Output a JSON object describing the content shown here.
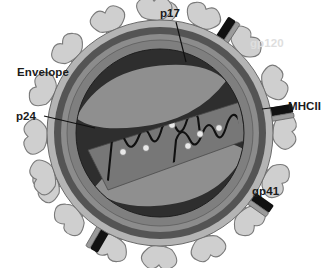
{
  "figure": {
    "background_color": "#ffffff",
    "width": 330,
    "height": 268
  },
  "labels": {
    "p17": "p17",
    "gp120": "gp120",
    "envelope": "Envelope",
    "p24": "p24",
    "mhcii": "MHCII",
    "gp41": "gp41"
  },
  "colors": {
    "background": "#ffffff",
    "envelope_outer_ring": "#b4b4b4",
    "envelope_dark_ring": "#545454",
    "envelope_mid_ring": "#8c8c8c",
    "matrix": "#7f7f7f",
    "interior_dark": "#2e2e2e",
    "capsid_band": "#777777",
    "lens_light": "#8f8f8f",
    "gp120_knob": "#cfcfcf",
    "gp120_knob_outline": "#7a7a7a",
    "gp41_stalk": "#a8a8a8",
    "mhcii_bar": "#111111",
    "mhcii_bar_stripe": "#9a9a9a",
    "rna_strand": "#101010",
    "enzyme_dot": "#e8e8e8",
    "label_dark": "#1b1b1b",
    "label_faded": "#dedede",
    "leader_line": "#101010"
  },
  "structure": {
    "virion_center": {
      "x": 160,
      "y": 133
    },
    "virion_radius": 113,
    "rings": [
      {
        "name": "outer-envelope-ring",
        "radius": 113,
        "color": "#b4b4b4"
      },
      {
        "name": "lipid-bilayer-dark-ring",
        "radius": 106,
        "color": "#545454"
      },
      {
        "name": "inner-envelope-ring",
        "radius": 99,
        "color": "#8c8c8c"
      },
      {
        "name": "matrix-p17-layer",
        "radius": 93,
        "color": "#7f7f7f"
      },
      {
        "name": "core-interior",
        "radius": 84,
        "color": "#2e2e2e"
      }
    ],
    "spike_count": 18,
    "mhcii_count": 4,
    "enzyme_dot_count": 6,
    "rna_strand_count": 2
  },
  "leader_lines": {
    "p17": {
      "from_x": 176,
      "from_y": 22,
      "to_x": 186,
      "to_y": 62
    },
    "p24": {
      "from_x": 44,
      "from_y": 116,
      "to_x": 95,
      "to_y": 128
    },
    "mhcii": {
      "from_x": 286,
      "from_y": 106,
      "to_x": 262,
      "to_y": 109
    }
  },
  "legend_items": [
    {
      "key": "gp120",
      "label": "gp120",
      "description": "envelope surface glycoprotein knob"
    },
    {
      "key": "gp41",
      "label": "gp41",
      "description": "transmembrane envelope glycoprotein stalk"
    },
    {
      "key": "envelope",
      "label": "Envelope",
      "description": "host-derived lipid bilayer"
    },
    {
      "key": "p17",
      "label": "p17",
      "description": "matrix protein layer"
    },
    {
      "key": "p24",
      "label": "p24",
      "description": "capsid core protein"
    },
    {
      "key": "mhcii",
      "label": "MHCII",
      "description": "host major histocompatibility complex class II"
    }
  ]
}
